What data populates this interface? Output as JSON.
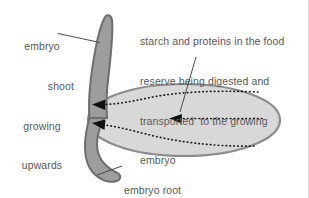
{
  "figure": {
    "background_color": "#ffffff",
    "text_color": "#5a5a5a",
    "border_color": "#d9d9d9"
  },
  "labels": {
    "shoot": {
      "line1": "embryo",
      "line2": "shoot",
      "line3": "growing",
      "line4": "upwards"
    },
    "food_reserve": {
      "line1": "starch and proteins in the food",
      "line2": "reserve being digested and",
      "line3": "transported  to the growing",
      "line4": "embryo"
    },
    "root": {
      "line1": "embryo root",
      "line2": "growing downwards"
    }
  },
  "shapes": {
    "endosperm": {
      "name": "food-reserve-ellipse",
      "fill": "#d8d8d8",
      "stroke": "#8c8c8c"
    },
    "embryo_axis": {
      "name": "embryo-shoot-and-root",
      "fill": "#9d9d9d",
      "stroke": "#6e6e6e"
    },
    "arrows": {
      "name": "transport-arrows",
      "color": "#1a1a1a",
      "style": "dotted",
      "count": 3,
      "direction": "pointing left toward embryo"
    },
    "leader_lines": {
      "color": "#4a4a4a"
    }
  }
}
